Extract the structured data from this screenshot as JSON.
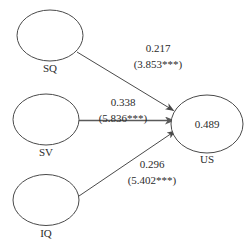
{
  "diagram": {
    "type": "path-model",
    "nodes": [
      {
        "id": "SQ",
        "label": "SQ",
        "value": ""
      },
      {
        "id": "SV",
        "label": "SV",
        "value": ""
      },
      {
        "id": "IQ",
        "label": "IQ",
        "value": ""
      },
      {
        "id": "US",
        "label": "US",
        "value": "0.489"
      }
    ],
    "edges": [
      {
        "from": "SQ",
        "to": "US",
        "coefficient": "0.217",
        "statistic": "(3.853***)"
      },
      {
        "from": "SV",
        "to": "US",
        "coefficient": "0.338",
        "statistic": "(5.836***)"
      },
      {
        "from": "IQ",
        "to": "US",
        "coefficient": "0.296",
        "statistic": "(5.402***)"
      }
    ]
  },
  "colors": {
    "stroke": "#4a4a4a",
    "text": "#2b2b2b",
    "background": "#ffffff"
  }
}
